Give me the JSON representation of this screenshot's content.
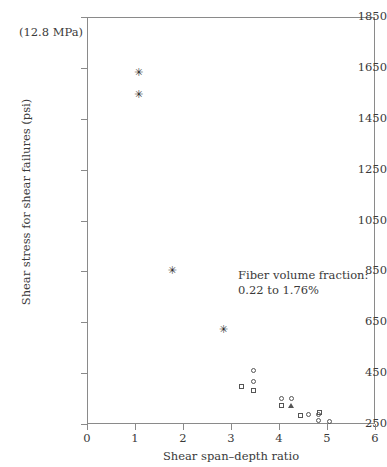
{
  "chart_data": {
    "type": "scatter",
    "title": "",
    "xlabel": "Shear span–depth ratio",
    "ylabel": "Shear stress for shear failures (psi)",
    "xlim": [
      0,
      6
    ],
    "ylim": [
      250,
      1850
    ],
    "xticks": [
      0,
      1,
      2,
      3,
      4,
      5,
      6
    ],
    "yticks": [
      250,
      450,
      650,
      850,
      1050,
      1250,
      1450,
      1650,
      1850
    ],
    "grid": false,
    "legend": "none",
    "top_left_note": "(12.8 MPa)",
    "annotation_lines": [
      "Fiber volume fraction:",
      "0.22 to 1.76%"
    ],
    "series": [
      {
        "name": "star-markers",
        "marker": "star",
        "points": [
          {
            "x": 1.05,
            "y": 1630
          },
          {
            "x": 1.05,
            "y": 1545
          },
          {
            "x": 1.75,
            "y": 855
          },
          {
            "x": 2.82,
            "y": 620
          }
        ]
      },
      {
        "name": "open-circles",
        "marker": "circle",
        "points": [
          {
            "x": 3.46,
            "y": 462
          },
          {
            "x": 3.46,
            "y": 418
          },
          {
            "x": 4.06,
            "y": 352
          },
          {
            "x": 4.26,
            "y": 352
          },
          {
            "x": 4.62,
            "y": 288
          },
          {
            "x": 4.82,
            "y": 288
          },
          {
            "x": 4.82,
            "y": 262
          },
          {
            "x": 5.05,
            "y": 258
          }
        ]
      },
      {
        "name": "open-squares",
        "marker": "square",
        "points": [
          {
            "x": 3.22,
            "y": 398
          },
          {
            "x": 3.46,
            "y": 382
          },
          {
            "x": 4.06,
            "y": 322
          },
          {
            "x": 4.44,
            "y": 285
          },
          {
            "x": 4.84,
            "y": 296
          }
        ]
      },
      {
        "name": "open-triangles",
        "marker": "triangle",
        "points": [
          {
            "x": 4.26,
            "y": 322
          }
        ]
      }
    ]
  }
}
